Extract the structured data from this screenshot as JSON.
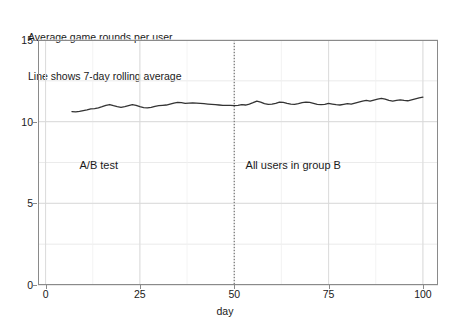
{
  "chart_data": {
    "type": "line",
    "title": "Average game rounds per user",
    "subtitle": "Line shows 7-day rolling average",
    "xlabel": "day",
    "ylabel": "",
    "xlim": [
      -2,
      104
    ],
    "ylim": [
      0,
      15
    ],
    "xticks": [
      0,
      25,
      50,
      75,
      100
    ],
    "xticklabels": [
      "0",
      "25",
      "50",
      "75",
      "100"
    ],
    "yticks": [
      0,
      5,
      10,
      15
    ],
    "yticklabels": [
      "0",
      "5",
      "10",
      "15"
    ],
    "grid": true,
    "grid_minor": true,
    "legend": null,
    "line_color": "#333333",
    "series": [
      {
        "name": "7-day rolling average",
        "x": [
          7,
          8,
          9,
          10,
          11,
          12,
          13,
          14,
          15,
          16,
          17,
          18,
          19,
          20,
          21,
          22,
          23,
          24,
          25,
          26,
          27,
          28,
          29,
          30,
          31,
          32,
          33,
          34,
          35,
          36,
          37,
          38,
          39,
          40,
          41,
          42,
          43,
          44,
          45,
          46,
          47,
          48,
          49,
          50,
          51,
          52,
          53,
          54,
          55,
          56,
          57,
          58,
          59,
          60,
          61,
          62,
          63,
          64,
          65,
          66,
          67,
          68,
          69,
          70,
          71,
          72,
          73,
          74,
          75,
          76,
          77,
          78,
          79,
          80,
          81,
          82,
          83,
          84,
          85,
          86,
          87,
          88,
          89,
          90,
          91,
          92,
          93,
          94,
          95,
          96,
          97,
          98,
          99,
          100
        ],
        "y": [
          10.62,
          10.6,
          10.63,
          10.68,
          10.72,
          10.78,
          10.8,
          10.85,
          10.92,
          11.0,
          11.05,
          10.98,
          10.92,
          10.88,
          10.92,
          10.98,
          11.04,
          11.0,
          10.92,
          10.86,
          10.84,
          10.88,
          10.94,
          10.98,
          11.0,
          11.02,
          11.08,
          11.14,
          11.18,
          11.16,
          11.12,
          11.14,
          11.15,
          11.14,
          11.12,
          11.1,
          11.08,
          11.06,
          11.04,
          11.02,
          11.0,
          11.0,
          11.0,
          10.98,
          11.0,
          11.05,
          11.02,
          11.08,
          11.16,
          11.26,
          11.2,
          11.1,
          11.06,
          11.08,
          11.12,
          11.2,
          11.18,
          11.12,
          11.08,
          11.06,
          11.1,
          11.16,
          11.2,
          11.18,
          11.12,
          11.06,
          11.04,
          11.06,
          11.12,
          11.08,
          11.04,
          11.02,
          11.06,
          11.1,
          11.08,
          11.14,
          11.2,
          11.26,
          11.3,
          11.26,
          11.32,
          11.38,
          11.42,
          11.38,
          11.3,
          11.26,
          11.3,
          11.34,
          11.3,
          11.28,
          11.34,
          11.4,
          11.46,
          11.5
        ]
      }
    ],
    "annotations": [
      {
        "name": "ab-test-label",
        "text": "A/B test",
        "x": 9,
        "y": 7.3
      },
      {
        "name": "group-b-label",
        "text": "All users in group B",
        "x": 53,
        "y": 7.3
      }
    ],
    "vlines": [
      {
        "x": 50,
        "style": "dotted",
        "color": "#555555"
      }
    ]
  }
}
